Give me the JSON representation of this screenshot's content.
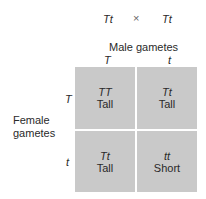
{
  "cross": {
    "parent1": "Tt",
    "symbol": "×",
    "parent2": "Tt"
  },
  "male_header": "Male gametes",
  "male_alleles": [
    "T",
    "t"
  ],
  "female_header_line1": "Female",
  "female_header_line2": "gametes",
  "female_alleles": [
    "T",
    "t"
  ],
  "cells": [
    {
      "genotype": "TT",
      "phenotype": "Tall"
    },
    {
      "genotype": "Tt",
      "phenotype": "Tall"
    },
    {
      "genotype": "Tt",
      "phenotype": "Tall"
    },
    {
      "genotype": "tt",
      "phenotype": "Short"
    }
  ],
  "colors": {
    "cell_fill": "#c9c9c9",
    "text": "#2a2a2a"
  }
}
